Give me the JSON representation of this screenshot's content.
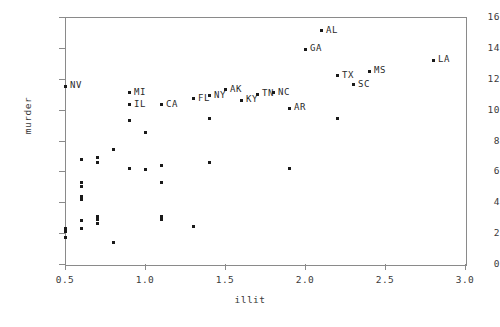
{
  "chart_data": {
    "type": "scatter",
    "title": "",
    "xlabel": "illit",
    "ylabel": "murder",
    "xlim": [
      0.5,
      3.0
    ],
    "ylim": [
      0,
      16
    ],
    "xticks": [
      "0.5",
      "1.0",
      "1.5",
      "2.0",
      "2.5",
      "3.0"
    ],
    "xtick_values": [
      0.5,
      1.0,
      1.5,
      2.0,
      2.5,
      3.0
    ],
    "yticks": [
      "0",
      "2",
      "4",
      "6",
      "8",
      "10",
      "12",
      "14",
      "16"
    ],
    "ytick_values": [
      0,
      2,
      4,
      6,
      8,
      10,
      12,
      14,
      16
    ],
    "grid": false,
    "legend": null,
    "marker": "point",
    "marker_color": "#1a1a1a",
    "frame_color": "#8a8a8a",
    "points": [
      {
        "label": "NV",
        "x": 0.5,
        "y": 11.5
      },
      {
        "label": "MI",
        "x": 0.9,
        "y": 11.1
      },
      {
        "label": "IL",
        "x": 0.9,
        "y": 10.3
      },
      {
        "label": "CA",
        "x": 1.1,
        "y": 10.3
      },
      {
        "label": "FL",
        "x": 1.3,
        "y": 10.7
      },
      {
        "label": "NY",
        "x": 1.4,
        "y": 10.9
      },
      {
        "label": "AK",
        "x": 1.5,
        "y": 11.3
      },
      {
        "label": "KY",
        "x": 1.6,
        "y": 10.6
      },
      {
        "label": "TN",
        "x": 1.7,
        "y": 11.0
      },
      {
        "label": "NC",
        "x": 1.8,
        "y": 11.1
      },
      {
        "label": "AR",
        "x": 1.9,
        "y": 10.1
      },
      {
        "label": "GA",
        "x": 2.0,
        "y": 13.9
      },
      {
        "label": "AL",
        "x": 2.1,
        "y": 15.1
      },
      {
        "label": "TX",
        "x": 2.2,
        "y": 12.2
      },
      {
        "label": "SC",
        "x": 2.3,
        "y": 11.6
      },
      {
        "label": "MS",
        "x": 2.4,
        "y": 12.5
      },
      {
        "label": "LA",
        "x": 2.8,
        "y": 13.2
      },
      {
        "label": "",
        "x": 0.5,
        "y": 2.3
      },
      {
        "label": "",
        "x": 0.5,
        "y": 2.1
      },
      {
        "label": "",
        "x": 0.5,
        "y": 1.7
      },
      {
        "label": "",
        "x": 0.6,
        "y": 6.8
      },
      {
        "label": "",
        "x": 0.6,
        "y": 5.3
      },
      {
        "label": "",
        "x": 0.6,
        "y": 5.0
      },
      {
        "label": "",
        "x": 0.6,
        "y": 4.4
      },
      {
        "label": "",
        "x": 0.6,
        "y": 4.2
      },
      {
        "label": "",
        "x": 0.6,
        "y": 2.8
      },
      {
        "label": "",
        "x": 0.6,
        "y": 2.3
      },
      {
        "label": "",
        "x": 0.7,
        "y": 6.9
      },
      {
        "label": "",
        "x": 0.7,
        "y": 6.6
      },
      {
        "label": "",
        "x": 0.7,
        "y": 3.1
      },
      {
        "label": "",
        "x": 0.7,
        "y": 2.9
      },
      {
        "label": "",
        "x": 0.7,
        "y": 2.6
      },
      {
        "label": "",
        "x": 0.8,
        "y": 7.4
      },
      {
        "label": "",
        "x": 0.8,
        "y": 1.4
      },
      {
        "label": "",
        "x": 0.9,
        "y": 9.3
      },
      {
        "label": "",
        "x": 0.9,
        "y": 6.2
      },
      {
        "label": "",
        "x": 1.0,
        "y": 8.5
      },
      {
        "label": "",
        "x": 1.0,
        "y": 6.1
      },
      {
        "label": "",
        "x": 1.1,
        "y": 6.4
      },
      {
        "label": "",
        "x": 1.1,
        "y": 5.3
      },
      {
        "label": "",
        "x": 1.1,
        "y": 3.1
      },
      {
        "label": "",
        "x": 1.1,
        "y": 2.9
      },
      {
        "label": "",
        "x": 1.3,
        "y": 2.4
      },
      {
        "label": "",
        "x": 1.4,
        "y": 6.6
      },
      {
        "label": "",
        "x": 1.4,
        "y": 9.4
      },
      {
        "label": "",
        "x": 1.9,
        "y": 6.2
      },
      {
        "label": "",
        "x": 2.2,
        "y": 9.4
      }
    ]
  }
}
